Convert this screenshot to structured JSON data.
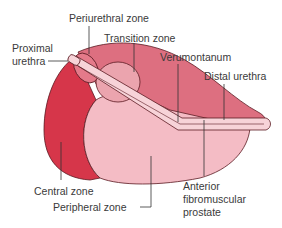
{
  "diagram": {
    "labels": {
      "periurethral_zone": "Periurethral zone",
      "transition_zone": "Transition zone",
      "proximal_urethra_line1": "Proximal",
      "proximal_urethra_line2": "urethra",
      "verumontanum": "Verumontanum",
      "distal_urethra": "Distal urethra",
      "central_zone": "Central zone",
      "peripheral_zone": "Peripheral zone",
      "anterior_line1": "Anterior",
      "anterior_line2": "fibromuscular",
      "anterior_line3": "prostate"
    },
    "colors": {
      "central_zone": "#d6364a",
      "anterior_fibromuscular": "#dd6f80",
      "transition_zone": "#eba4ae",
      "peripheral_zone": "#f4bcc5",
      "urethra": "#f7d3d8",
      "outline": "#5a1a22",
      "leader": "#333333"
    }
  }
}
